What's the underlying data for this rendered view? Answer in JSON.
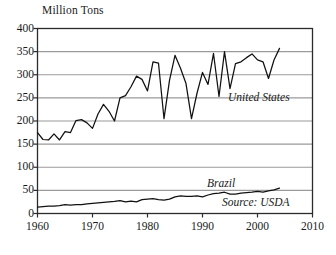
{
  "chart_data": {
    "type": "line",
    "title": "",
    "subtitle": "",
    "xlabel": "",
    "ylabel": "Million Tons",
    "xlim": [
      1960,
      2010
    ],
    "ylim": [
      0,
      400
    ],
    "grid": true,
    "grid_axis": "y",
    "legend_position": "inline-annotation",
    "xticks": [
      1960,
      1970,
      1980,
      1990,
      2000,
      2010
    ],
    "yticks": [
      0,
      50,
      100,
      150,
      200,
      250,
      300,
      350,
      400
    ],
    "annotations": [
      {
        "text": "United States",
        "x": 1996,
        "y": 268
      },
      {
        "text": "Brazil",
        "x": 1993,
        "y": 80
      },
      {
        "text": "Source: USDA",
        "x": 1999,
        "y": 38
      }
    ],
    "x": [
      1960,
      1961,
      1962,
      1963,
      1964,
      1965,
      1966,
      1967,
      1968,
      1969,
      1970,
      1971,
      1972,
      1973,
      1974,
      1975,
      1976,
      1977,
      1978,
      1979,
      1980,
      1981,
      1982,
      1983,
      1984,
      1985,
      1986,
      1987,
      1988,
      1989,
      1990,
      1991,
      1992,
      1993,
      1994,
      1995,
      1996,
      1997,
      1998,
      1999,
      2000,
      2001,
      2002,
      2003,
      2004
    ],
    "series": [
      {
        "name": "United States",
        "color": "#111111",
        "values": [
          175,
          160,
          159,
          172,
          159,
          177,
          175,
          201,
          203,
          196,
          184,
          215,
          236,
          221,
          200,
          250,
          255,
          274,
          297,
          290,
          265,
          328,
          325,
          205,
          288,
          342,
          314,
          281,
          205,
          260,
          305,
          279,
          346,
          253,
          350,
          270,
          324,
          328,
          337,
          345,
          332,
          328,
          292,
          332,
          357
        ]
      },
      {
        "name": "Brazil",
        "color": "#111111",
        "values": [
          14,
          15,
          16,
          16,
          17,
          19,
          18,
          19,
          19,
          21,
          22,
          23,
          24,
          25,
          26,
          28,
          25,
          27,
          25,
          30,
          31,
          32,
          30,
          29,
          31,
          36,
          38,
          37,
          37,
          38,
          36,
          40,
          43,
          44,
          46,
          42,
          42,
          44,
          45,
          46,
          48,
          46,
          49,
          51,
          55
        ]
      }
    ]
  }
}
